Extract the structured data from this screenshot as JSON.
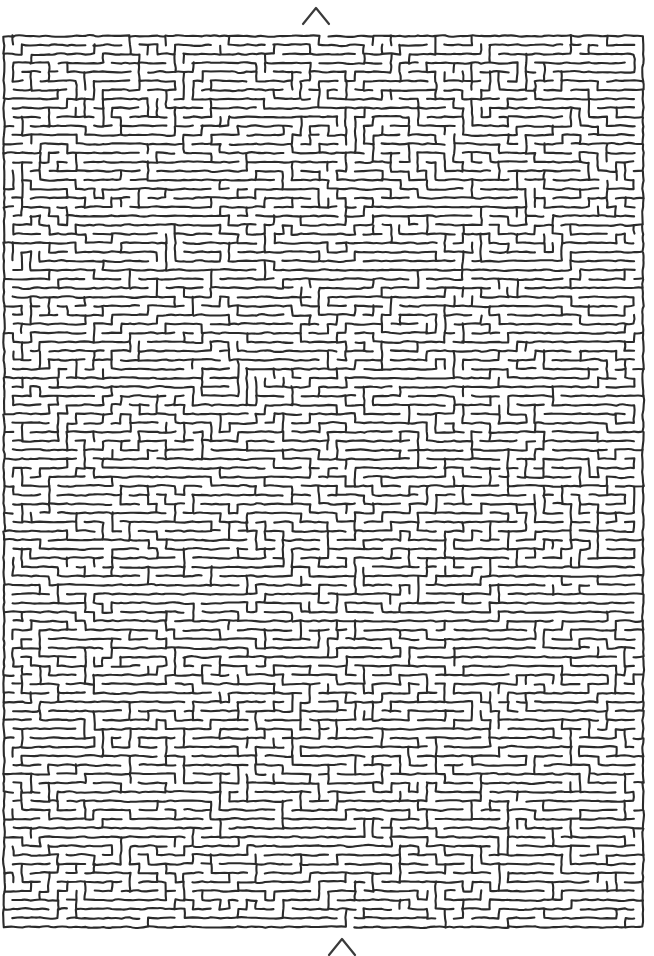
{
  "document": {
    "type": "maze-puzzle",
    "title": "Maze",
    "style": "hand-drawn space-filling labyrinth",
    "background_color": "#ffffff",
    "ink_color": "#2b2b2b",
    "canvas": {
      "width": 654,
      "height": 956
    }
  },
  "maze": {
    "name": "space-filling-labyrinth",
    "bounds": {
      "x": 4,
      "y": 36,
      "width": 646,
      "height": 892
    },
    "line_color": "#2b2b2b",
    "line_width": 2.1,
    "corridor_spacing": 9,
    "description": "Dense organic meandering single-stroke corridors filling a tall rectangle",
    "features": [
      {
        "name": "nested-loop-cluster",
        "x": 575,
        "y": 295
      },
      {
        "name": "nested-loop-cluster",
        "x": 520,
        "y": 780
      },
      {
        "name": "nested-loop-cluster",
        "x": 340,
        "y": 680
      },
      {
        "name": "nested-loop-cluster",
        "x": 612,
        "y": 900
      },
      {
        "name": "nested-loop-cluster",
        "x": 90,
        "y": 875
      }
    ]
  },
  "markers": {
    "entrance": {
      "name": "entrance-chevron",
      "glyph": "^",
      "x": 316,
      "y": 16,
      "label": "Start"
    },
    "exit": {
      "name": "exit-chevron",
      "glyph": "^",
      "x": 342,
      "y": 947,
      "label": "Finish"
    }
  },
  "accessibility": {
    "maze_alt": "A dense hand-drawn maze of winding parallel corridors filling the page",
    "entrance_alt": "Chevron marker indicating the maze entrance at top center",
    "exit_alt": "Chevron marker indicating the maze exit at bottom center"
  }
}
